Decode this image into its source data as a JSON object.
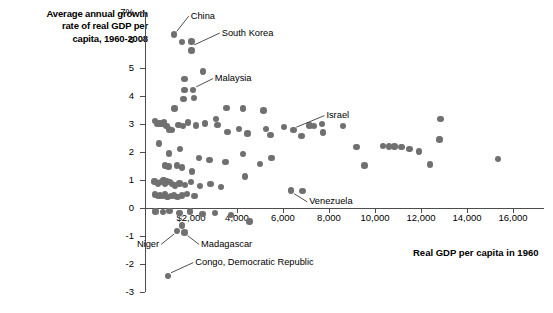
{
  "chart_data": {
    "type": "scatter",
    "title": "Average annual growth\nrate of real GDP per\ncapita, 1960-2008",
    "ylabel": "Average annual growth rate of real GDP per capita, 1960-2008",
    "xlabel": "Real GDP per capita in 1960",
    "xlim": [
      0,
      16800
    ],
    "ylim": [
      -3,
      7
    ],
    "grid": false,
    "legend": null,
    "y_ticks": [
      {
        "value": 7,
        "label": "7%"
      },
      {
        "value": 6,
        "label": "6"
      },
      {
        "value": 5,
        "label": "5"
      },
      {
        "value": 4,
        "label": "4"
      },
      {
        "value": 3,
        "label": "3"
      },
      {
        "value": 2,
        "label": "2"
      },
      {
        "value": 1,
        "label": "1"
      },
      {
        "value": 0,
        "label": "0"
      },
      {
        "value": -1,
        "label": "-1"
      },
      {
        "value": -2,
        "label": "-2"
      },
      {
        "value": -3,
        "label": "-3"
      }
    ],
    "x_ticks": [
      {
        "value": 2000,
        "label": "$2,000"
      },
      {
        "value": 4000,
        "label": "4,000"
      },
      {
        "value": 6000,
        "label": "6,000"
      },
      {
        "value": 8000,
        "label": "8,000"
      },
      {
        "value": 10000,
        "label": "10,000"
      },
      {
        "value": 12000,
        "label": "12,000"
      },
      {
        "value": 14000,
        "label": "14,000"
      },
      {
        "value": 16000,
        "label": "16,000"
      }
    ],
    "point_color": "#707070",
    "axis_color": "#4d4d4d",
    "annotations": [
      {
        "label": "China",
        "x": 1250,
        "y": 6.2,
        "lx": 1900,
        "ly": 6.85
      },
      {
        "label": "South Korea",
        "x": 2020,
        "y": 5.72,
        "lx": 3250,
        "ly": 6.25
      },
      {
        "label": "Malaysia",
        "x": 2100,
        "y": 4.22,
        "lx": 2950,
        "ly": 4.62
      },
      {
        "label": "Israel",
        "x": 6450,
        "y": 2.78,
        "lx": 7800,
        "ly": 3.3
      },
      {
        "label": "Venezuela",
        "x": 6350,
        "y": 0.62,
        "lx": 7050,
        "ly": 0.22
      },
      {
        "label": "Niger",
        "x": 1400,
        "y": -0.82,
        "lx": 700,
        "ly": -1.3
      },
      {
        "label": "Madagascar",
        "x": 1720,
        "y": -0.88,
        "lx": 2350,
        "ly": -1.3
      },
      {
        "label": "Congo, Democratic Republic",
        "x": 1000,
        "y": -2.42,
        "lx": 2100,
        "ly": -1.95
      }
    ],
    "points": [
      {
        "x": 1250,
        "y": 6.2
      },
      {
        "x": 1620,
        "y": 5.92
      },
      {
        "x": 2020,
        "y": 5.95
      },
      {
        "x": 2020,
        "y": 5.62
      },
      {
        "x": 1720,
        "y": 4.6
      },
      {
        "x": 2100,
        "y": 4.22
      },
      {
        "x": 1720,
        "y": 4.22
      },
      {
        "x": 2520,
        "y": 4.88
      },
      {
        "x": 1680,
        "y": 3.9
      },
      {
        "x": 2120,
        "y": 3.92
      },
      {
        "x": 1280,
        "y": 3.55
      },
      {
        "x": 3550,
        "y": 3.58
      },
      {
        "x": 4250,
        "y": 3.55
      },
      {
        "x": 5150,
        "y": 3.48
      },
      {
        "x": 430,
        "y": 3.1
      },
      {
        "x": 520,
        "y": 3.0
      },
      {
        "x": 620,
        "y": 3.02
      },
      {
        "x": 720,
        "y": 3.02
      },
      {
        "x": 830,
        "y": 3.05
      },
      {
        "x": 930,
        "y": 2.92
      },
      {
        "x": 1050,
        "y": 2.8
      },
      {
        "x": 1180,
        "y": 2.78
      },
      {
        "x": 1450,
        "y": 2.96
      },
      {
        "x": 1650,
        "y": 2.92
      },
      {
        "x": 1880,
        "y": 3.06
      },
      {
        "x": 2220,
        "y": 2.95
      },
      {
        "x": 2600,
        "y": 3.02
      },
      {
        "x": 3080,
        "y": 3.18
      },
      {
        "x": 3150,
        "y": 2.96
      },
      {
        "x": 3580,
        "y": 2.72
      },
      {
        "x": 4100,
        "y": 2.82
      },
      {
        "x": 4450,
        "y": 2.66
      },
      {
        "x": 5250,
        "y": 2.82
      },
      {
        "x": 5450,
        "y": 2.6
      },
      {
        "x": 6050,
        "y": 2.9
      },
      {
        "x": 6450,
        "y": 2.78
      },
      {
        "x": 6800,
        "y": 2.58
      },
      {
        "x": 7150,
        "y": 2.95
      },
      {
        "x": 7350,
        "y": 2.92
      },
      {
        "x": 7700,
        "y": 3.0
      },
      {
        "x": 7750,
        "y": 2.7
      },
      {
        "x": 8600,
        "y": 2.92
      },
      {
        "x": 10350,
        "y": 2.22
      },
      {
        "x": 10600,
        "y": 2.2
      },
      {
        "x": 10850,
        "y": 2.2
      },
      {
        "x": 11150,
        "y": 2.18
      },
      {
        "x": 11500,
        "y": 2.1
      },
      {
        "x": 11900,
        "y": 2.02
      },
      {
        "x": 12850,
        "y": 3.18
      },
      {
        "x": 12800,
        "y": 2.45
      },
      {
        "x": 15350,
        "y": 1.75
      },
      {
        "x": 12400,
        "y": 1.55
      },
      {
        "x": 9550,
        "y": 1.52
      },
      {
        "x": 9200,
        "y": 2.18
      },
      {
        "x": 620,
        "y": 2.3
      },
      {
        "x": 1050,
        "y": 1.95
      },
      {
        "x": 1520,
        "y": 2.1
      },
      {
        "x": 2350,
        "y": 1.78
      },
      {
        "x": 2800,
        "y": 1.72
      },
      {
        "x": 3500,
        "y": 1.65
      },
      {
        "x": 4250,
        "y": 1.92
      },
      {
        "x": 5000,
        "y": 1.58
      },
      {
        "x": 5500,
        "y": 1.78
      },
      {
        "x": 860,
        "y": 1.52
      },
      {
        "x": 1020,
        "y": 1.48
      },
      {
        "x": 1380,
        "y": 1.52
      },
      {
        "x": 1620,
        "y": 1.45
      },
      {
        "x": 2050,
        "y": 1.3
      },
      {
        "x": 420,
        "y": 0.95
      },
      {
        "x": 560,
        "y": 0.88
      },
      {
        "x": 700,
        "y": 0.92
      },
      {
        "x": 800,
        "y": 1.0
      },
      {
        "x": 880,
        "y": 0.88
      },
      {
        "x": 960,
        "y": 0.95
      },
      {
        "x": 1080,
        "y": 0.92
      },
      {
        "x": 1180,
        "y": 0.85
      },
      {
        "x": 1300,
        "y": 0.8
      },
      {
        "x": 1500,
        "y": 0.88
      },
      {
        "x": 1750,
        "y": 0.82
      },
      {
        "x": 2000,
        "y": 0.92
      },
      {
        "x": 2400,
        "y": 0.78
      },
      {
        "x": 2850,
        "y": 0.85
      },
      {
        "x": 3300,
        "y": 0.75
      },
      {
        "x": 4350,
        "y": 1.12
      },
      {
        "x": 6350,
        "y": 0.62
      },
      {
        "x": 6850,
        "y": 0.6
      },
      {
        "x": 430,
        "y": 0.48
      },
      {
        "x": 560,
        "y": 0.42
      },
      {
        "x": 660,
        "y": 0.45
      },
      {
        "x": 780,
        "y": 0.42
      },
      {
        "x": 880,
        "y": 0.48
      },
      {
        "x": 980,
        "y": 0.4
      },
      {
        "x": 1120,
        "y": 0.42
      },
      {
        "x": 1260,
        "y": 0.45
      },
      {
        "x": 1420,
        "y": 0.4
      },
      {
        "x": 1600,
        "y": 0.45
      },
      {
        "x": 1820,
        "y": 0.5
      },
      {
        "x": 2150,
        "y": 0.42
      },
      {
        "x": 450,
        "y": -0.12
      },
      {
        "x": 780,
        "y": -0.15
      },
      {
        "x": 1060,
        "y": -0.1
      },
      {
        "x": 1500,
        "y": -0.18
      },
      {
        "x": 1950,
        "y": -0.12
      },
      {
        "x": 2500,
        "y": -0.22
      },
      {
        "x": 3050,
        "y": -0.18
      },
      {
        "x": 3750,
        "y": -0.25
      },
      {
        "x": 4550,
        "y": -0.48
      },
      {
        "x": 1400,
        "y": -0.82
      },
      {
        "x": 1720,
        "y": -0.88
      },
      {
        "x": 1600,
        "y": -0.62
      },
      {
        "x": 1000,
        "y": -2.42
      }
    ]
  }
}
